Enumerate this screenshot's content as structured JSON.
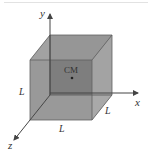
{
  "diagram": {
    "type": "3d-cube-with-axes",
    "axes": {
      "x_label": "x",
      "y_label": "y",
      "z_label": "z"
    },
    "cube": {
      "side_labels": [
        "L",
        "L",
        "L"
      ],
      "center_label": "CM"
    },
    "colors": {
      "front_face": "#8c8c8c",
      "back_face": "#6f6f6f",
      "side_face": "#a3a3a3",
      "top_face": "#9a9a9a",
      "edges": "#5a5a5a",
      "axes": "#444444",
      "background": "#ffffff"
    }
  }
}
